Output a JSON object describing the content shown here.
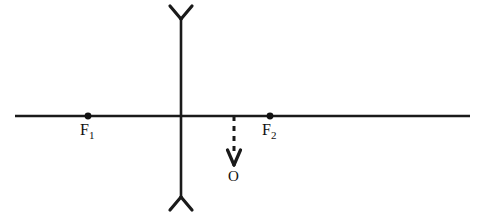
{
  "diagram": {
    "type": "optics-ray-diagram",
    "colors": {
      "ink": "#1a1a1a",
      "background": "#ffffff"
    },
    "labels": {
      "focal_left": {
        "text": "F",
        "subscript": "1",
        "name": "F1"
      },
      "focal_right": {
        "text": "F",
        "subscript": "2",
        "name": "F2"
      },
      "object": {
        "text": "O",
        "name": "O"
      }
    },
    "geometry": {
      "axis": {
        "x1": 15,
        "y": 116,
        "x2": 470
      },
      "lens": {
        "x": 181,
        "y_top": 18,
        "y_bottom": 198,
        "top_arm_left_x": 170,
        "top_arm_right_x": 192,
        "top_arm_y": 6,
        "bottom_arm_left_x": 170,
        "bottom_arm_right_x": 192,
        "bottom_arm_y": 210
      },
      "focal_points": [
        {
          "name": "F1",
          "x": 88,
          "y": 116,
          "radius": 3.4
        },
        {
          "name": "F2",
          "x": 270,
          "y": 116,
          "radius": 3.4
        }
      ],
      "object_ray": {
        "x": 234,
        "y_start": 116,
        "y_end": 164,
        "arrow_half_width": 6.5,
        "arrow_height": 15
      }
    }
  }
}
